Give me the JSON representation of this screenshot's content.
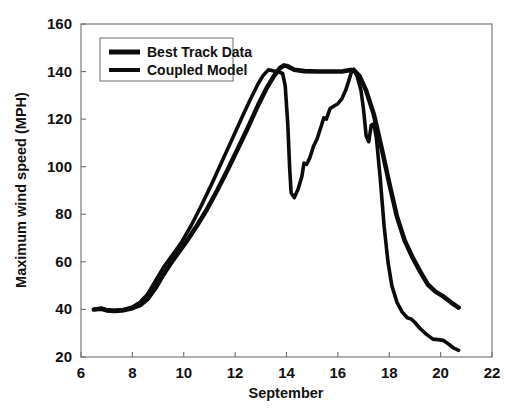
{
  "chart_data": {
    "type": "line",
    "title": "",
    "xlabel": "September",
    "ylabel": "Maximum wind speed (MPH)",
    "xlim": [
      6,
      22
    ],
    "ylim": [
      20,
      160
    ],
    "xticks": [
      6,
      8,
      10,
      12,
      14,
      16,
      18,
      20,
      22
    ],
    "xtick_labels": [
      "6",
      "8",
      "10",
      "12",
      "14",
      "16",
      "18",
      "20",
      "22"
    ],
    "yticks": [
      20,
      40,
      60,
      80,
      100,
      120,
      140,
      160
    ],
    "ytick_labels": [
      "20",
      "40",
      "60",
      "80",
      "100",
      "120",
      "140",
      "160"
    ],
    "grid": false,
    "legend_position": "upper left",
    "line_color": "#0c0c0c",
    "background_color": "#ffffff",
    "axis_color": "#6e6e6e",
    "series": [
      {
        "name": "Best Track Data",
        "line_width": 4.6,
        "x": [
          6.5,
          6.8,
          7.0,
          7.3,
          7.6,
          8.0,
          8.3,
          8.6,
          8.9,
          9.2,
          9.5,
          9.8,
          10.1,
          10.5,
          10.9,
          11.3,
          11.7,
          12.1,
          12.5,
          12.9,
          13.2,
          13.5,
          13.75,
          13.9,
          14.05,
          14.3,
          14.7,
          15.2,
          15.7,
          16.2,
          16.5,
          16.65,
          16.85,
          17.1,
          17.4,
          17.7,
          18.0,
          18.3,
          18.6,
          18.9,
          19.2,
          19.5,
          19.8,
          20.1,
          20.4,
          20.7
        ],
        "y": [
          40.0,
          40.3,
          39.6,
          39.4,
          39.6,
          40.5,
          41.8,
          44.5,
          49.0,
          54.5,
          59.5,
          64.0,
          68.5,
          75.0,
          82.0,
          90.0,
          98.5,
          107.5,
          116.5,
          126.0,
          132.5,
          138.0,
          141.5,
          142.6,
          142.2,
          140.8,
          140.2,
          140.0,
          140.0,
          140.1,
          140.7,
          140.3,
          138.0,
          132.0,
          122.0,
          108.0,
          93.0,
          79.0,
          69.0,
          62.0,
          56.0,
          50.5,
          47.5,
          45.5,
          43.0,
          40.8
        ]
      },
      {
        "name": "Coupled Model",
        "line_width": 3.6,
        "x": [
          6.5,
          6.8,
          7.0,
          7.3,
          7.6,
          8.0,
          8.3,
          8.6,
          8.9,
          9.2,
          9.5,
          9.9,
          10.3,
          10.7,
          11.1,
          11.5,
          11.9,
          12.3,
          12.6,
          12.9,
          13.1,
          13.3,
          13.5,
          13.7,
          13.85,
          13.95,
          14.05,
          14.12,
          14.18,
          14.3,
          14.45,
          14.6,
          14.68,
          14.78,
          14.9,
          15.05,
          15.2,
          15.35,
          15.45,
          15.55,
          15.7,
          15.85,
          16.0,
          16.15,
          16.3,
          16.42,
          16.52,
          16.62,
          16.75,
          16.9,
          17.0,
          17.1,
          17.2,
          17.3,
          17.4,
          17.5,
          17.65,
          17.8,
          17.95,
          18.1,
          18.3,
          18.5,
          18.7,
          18.85,
          19.0,
          19.2,
          19.45,
          19.7,
          19.9,
          20.1,
          20.3,
          20.5,
          20.7
        ],
        "y": [
          40.0,
          40.5,
          39.8,
          39.5,
          39.8,
          41.0,
          43.0,
          46.5,
          52.0,
          57.5,
          62.0,
          68.0,
          75.5,
          84.0,
          93.0,
          102.5,
          112.0,
          121.5,
          128.5,
          135.0,
          138.5,
          140.8,
          140.2,
          139.8,
          139.2,
          134.0,
          118.0,
          100.0,
          89.0,
          87.0,
          90.5,
          96.0,
          101.5,
          101.0,
          103.5,
          108.5,
          112.0,
          117.0,
          120.5,
          120.0,
          124.5,
          125.5,
          126.5,
          128.5,
          132.0,
          136.0,
          139.5,
          141.0,
          138.0,
          132.0,
          124.0,
          113.0,
          110.5,
          117.5,
          118.0,
          112.0,
          95.0,
          75.0,
          60.0,
          50.0,
          43.0,
          39.0,
          36.5,
          36.0,
          34.5,
          32.0,
          29.5,
          27.5,
          27.3,
          27.0,
          25.5,
          23.8,
          22.8
        ]
      }
    ]
  },
  "legend": {
    "items": [
      {
        "label": "Best Track Data"
      },
      {
        "label": "Coupled Model"
      }
    ]
  },
  "axes": {
    "x_title": "September",
    "y_title": "Maximum wind speed (MPH)"
  }
}
